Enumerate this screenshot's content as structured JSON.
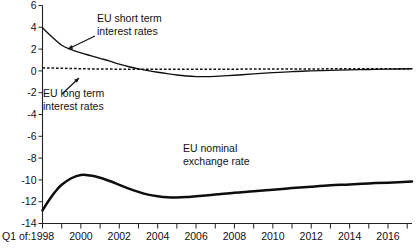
{
  "chart_data": {
    "type": "line",
    "title": "",
    "xlabel": "Q1 of:",
    "ylabel": "",
    "ylim": [
      -14,
      6
    ],
    "xlim": [
      1998,
      2017.25
    ],
    "grid": false,
    "legend_position": "inline-annotations",
    "yticks": [
      "6",
      "4",
      "2",
      "0",
      "-2",
      "-4",
      "-6",
      "-8",
      "-10",
      "-12",
      "-14"
    ],
    "ytick_values": [
      6,
      4,
      2,
      0,
      -2,
      -4,
      -6,
      -8,
      -10,
      -12,
      -14
    ],
    "xticks": [
      "1998",
      "2000",
      "2002",
      "2004",
      "2006",
      "2008",
      "2010",
      "2012",
      "2014",
      "2016"
    ],
    "xtick_values": [
      1998,
      2000,
      2002,
      2004,
      2006,
      2008,
      2010,
      2012,
      2014,
      2016
    ],
    "minor_xtick_values": [
      1999,
      2001,
      2003,
      2005,
      2007,
      2009,
      2011,
      2013,
      2015,
      2017
    ],
    "axis_origin_label": "Q1 of:",
    "series": [
      {
        "name": "EU short term interest rates",
        "style": "solid",
        "x": [
          1998,
          1998.5,
          1999,
          1999.5,
          2000,
          2000.5,
          2001,
          2001.5,
          2002,
          2002.5,
          2003,
          2003.5,
          2004,
          2004.5,
          2005,
          2005.5,
          2006,
          2006.5,
          2007,
          2008,
          2009,
          2010,
          2011,
          2012,
          2013,
          2014,
          2015,
          2016,
          2017.25
        ],
        "values": [
          3.95,
          3.1,
          2.35,
          1.95,
          1.65,
          1.4,
          1.15,
          0.9,
          0.62,
          0.38,
          0.18,
          0.02,
          -0.12,
          -0.25,
          -0.38,
          -0.47,
          -0.52,
          -0.53,
          -0.5,
          -0.4,
          -0.28,
          -0.16,
          -0.06,
          0.0,
          0.05,
          0.1,
          0.13,
          0.16,
          0.2
        ]
      },
      {
        "name": "EU long term interest rates",
        "style": "dashed",
        "x": [
          1998,
          1999,
          2000,
          2001,
          2002,
          2003,
          2004,
          2005,
          2006,
          2007,
          2008,
          2009,
          2010,
          2011,
          2012,
          2013,
          2014,
          2015,
          2016,
          2017.25
        ],
        "values": [
          0.28,
          0.24,
          0.2,
          0.17,
          0.16,
          0.15,
          0.15,
          0.15,
          0.15,
          0.16,
          0.16,
          0.17,
          0.17,
          0.18,
          0.18,
          0.19,
          0.19,
          0.2,
          0.2,
          0.2
        ]
      },
      {
        "name": "EU nominal exchange rate",
        "style": "thick-solid",
        "x": [
          1998,
          1998.25,
          1998.5,
          1998.75,
          1999,
          1999.5,
          2000,
          2000.5,
          2001,
          2001.5,
          2002,
          2002.5,
          2003,
          2003.5,
          2004,
          2004.5,
          2005,
          2005.5,
          2006,
          2007,
          2008,
          2009,
          2010,
          2011,
          2012,
          2013,
          2014,
          2015,
          2016,
          2017.25
        ],
        "values": [
          -12.8,
          -12.1,
          -11.45,
          -10.9,
          -10.45,
          -9.85,
          -9.55,
          -9.6,
          -9.8,
          -10.1,
          -10.45,
          -10.8,
          -11.1,
          -11.35,
          -11.5,
          -11.6,
          -11.62,
          -11.58,
          -11.5,
          -11.35,
          -11.18,
          -11.05,
          -10.9,
          -10.75,
          -10.62,
          -10.5,
          -10.42,
          -10.32,
          -10.25,
          -10.15
        ]
      }
    ],
    "annotations": [
      {
        "id": "short-term",
        "lines": [
          "EU short term",
          "interest rates"
        ],
        "text_x": 97,
        "text_y": 22,
        "leader": {
          "x1": 95,
          "y1": 36,
          "x2": 68,
          "y2": 49
        }
      },
      {
        "id": "long-term",
        "lines": [
          "EU long term",
          "interest rates"
        ],
        "text_x": 43,
        "text_y": 97,
        "leader": {
          "x1": 62,
          "y1": 94,
          "x2": 79,
          "y2": 78
        }
      },
      {
        "id": "exchange-rate",
        "lines": [
          "EU nominal",
          "exchange rate"
        ],
        "text_x": 183,
        "text_y": 152,
        "leader": null
      }
    ]
  }
}
